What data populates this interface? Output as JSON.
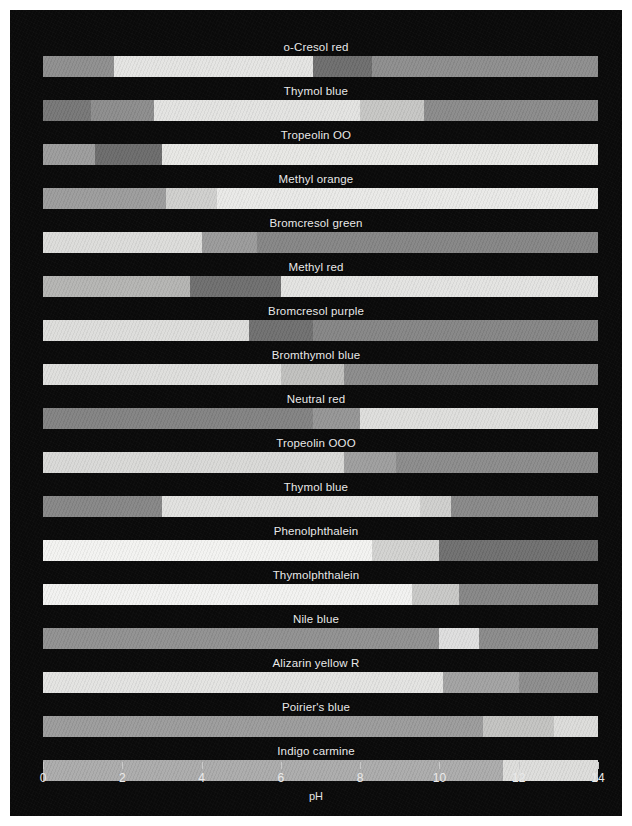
{
  "figure": {
    "background_color": "#0a0a0a",
    "plot_left_px": 33,
    "plot_right_px": 588,
    "row_height_px": 44,
    "first_row_top_px": 30
  },
  "axis": {
    "title": "pH",
    "min": 0,
    "max": 14,
    "tick_labels": [
      "0",
      "2",
      "4",
      "6",
      "8",
      "10",
      "12",
      "14"
    ],
    "tick_values": [
      0,
      2,
      4,
      6,
      8,
      10,
      12,
      14
    ],
    "tick_color": "#c9c9c9",
    "label_color": "#eaeaea"
  },
  "chart_data": {
    "type": "bar",
    "title": "",
    "subtitle": "",
    "xlabel": "pH",
    "ylabel": "",
    "xlim": [
      0,
      14
    ],
    "grid": false,
    "legend": "none",
    "orientation": "horizontal-stacked-range",
    "categories": [
      "o-Cresol red",
      "Thymol blue",
      "Tropeolin OO",
      "Methyl orange",
      "Bromcresol green",
      "Methyl red",
      "Bromcresol purple",
      "Bromthymol blue",
      "Neutral red",
      "Tropeolin OOO",
      "Thymol blue",
      "Phenolphthalein",
      "Thymolphthalein",
      "Nile blue",
      "Alizarin yellow R",
      "Poirier's blue",
      "Indigo carmine"
    ],
    "rows": [
      {
        "label": "o-Cresol red",
        "segments": [
          {
            "start": 0.0,
            "end": 1.8,
            "color": "#8e8e8e"
          },
          {
            "start": 1.8,
            "end": 6.8,
            "color": "#e4e4e2"
          },
          {
            "start": 6.8,
            "end": 8.3,
            "color": "#6d6d6d"
          },
          {
            "start": 8.3,
            "end": 14.0,
            "color": "#8d8d8d"
          }
        ]
      },
      {
        "label": "Thymol blue",
        "segments": [
          {
            "start": 0.0,
            "end": 1.2,
            "color": "#767676"
          },
          {
            "start": 1.2,
            "end": 2.8,
            "color": "#8c8c8c"
          },
          {
            "start": 2.8,
            "end": 8.0,
            "color": "#e3e3e1"
          },
          {
            "start": 8.0,
            "end": 9.6,
            "color": "#c6c6c4"
          },
          {
            "start": 9.6,
            "end": 14.0,
            "color": "#8a8a8a"
          }
        ]
      },
      {
        "label": "Tropeolin OO",
        "segments": [
          {
            "start": 0.0,
            "end": 1.3,
            "color": "#9c9c9c"
          },
          {
            "start": 1.3,
            "end": 3.0,
            "color": "#6b6b6b"
          },
          {
            "start": 3.0,
            "end": 14.0,
            "color": "#e7e7e4"
          }
        ]
      },
      {
        "label": "Methyl orange",
        "segments": [
          {
            "start": 0.0,
            "end": 3.1,
            "color": "#9c9c9c"
          },
          {
            "start": 3.1,
            "end": 4.4,
            "color": "#cfcfcd"
          },
          {
            "start": 4.4,
            "end": 14.0,
            "color": "#e9e9e7"
          }
        ]
      },
      {
        "label": "Bromcresol green",
        "segments": [
          {
            "start": 0.0,
            "end": 4.0,
            "color": "#dcdcda"
          },
          {
            "start": 4.0,
            "end": 5.4,
            "color": "#9a9a9a"
          },
          {
            "start": 5.4,
            "end": 14.0,
            "color": "#858585"
          }
        ]
      },
      {
        "label": "Methyl red",
        "segments": [
          {
            "start": 0.0,
            "end": 3.7,
            "color": "#b4b4b2"
          },
          {
            "start": 3.7,
            "end": 6.0,
            "color": "#6e6e6e"
          },
          {
            "start": 6.0,
            "end": 14.0,
            "color": "#e3e3e1"
          }
        ]
      },
      {
        "label": "Bromcresol purple",
        "segments": [
          {
            "start": 0.0,
            "end": 5.2,
            "color": "#dddddb"
          },
          {
            "start": 5.2,
            "end": 6.8,
            "color": "#6f6f6f"
          },
          {
            "start": 6.8,
            "end": 14.0,
            "color": "#858585"
          }
        ]
      },
      {
        "label": "Bromthymol blue",
        "segments": [
          {
            "start": 0.0,
            "end": 6.0,
            "color": "#dededc"
          },
          {
            "start": 6.0,
            "end": 7.6,
            "color": "#c0c0be"
          },
          {
            "start": 7.6,
            "end": 14.0,
            "color": "#8b8b8b"
          }
        ]
      },
      {
        "label": "Neutral red",
        "segments": [
          {
            "start": 0.0,
            "end": 6.8,
            "color": "#828282"
          },
          {
            "start": 6.8,
            "end": 8.0,
            "color": "#959595"
          },
          {
            "start": 8.0,
            "end": 14.0,
            "color": "#dededc"
          }
        ]
      },
      {
        "label": "Tropeolin OOO",
        "segments": [
          {
            "start": 0.0,
            "end": 7.6,
            "color": "#d9d9d7"
          },
          {
            "start": 7.6,
            "end": 8.9,
            "color": "#9e9e9e"
          },
          {
            "start": 8.9,
            "end": 14.0,
            "color": "#8b8b8b"
          }
        ]
      },
      {
        "label": "Thymol blue",
        "segments": [
          {
            "start": 0.0,
            "end": 3.0,
            "color": "#868686"
          },
          {
            "start": 3.0,
            "end": 9.5,
            "color": "#e1e1df"
          },
          {
            "start": 9.5,
            "end": 10.3,
            "color": "#cfcfcd"
          },
          {
            "start": 10.3,
            "end": 14.0,
            "color": "#888888"
          }
        ]
      },
      {
        "label": "Phenolphthalein",
        "segments": [
          {
            "start": 0.0,
            "end": 8.3,
            "color": "#f3f3f1"
          },
          {
            "start": 8.3,
            "end": 10.0,
            "color": "#d2d2d0"
          },
          {
            "start": 10.0,
            "end": 14.0,
            "color": "#6f6f6f"
          }
        ]
      },
      {
        "label": "Thymolphthalein",
        "segments": [
          {
            "start": 0.0,
            "end": 9.3,
            "color": "#f2f2f0"
          },
          {
            "start": 9.3,
            "end": 10.5,
            "color": "#c8c8c6"
          },
          {
            "start": 10.5,
            "end": 14.0,
            "color": "#868686"
          }
        ]
      },
      {
        "label": "Nile blue",
        "segments": [
          {
            "start": 0.0,
            "end": 10.0,
            "color": "#909090"
          },
          {
            "start": 10.0,
            "end": 11.0,
            "color": "#dedede"
          },
          {
            "start": 11.0,
            "end": 14.0,
            "color": "#8a8a8a"
          }
        ]
      },
      {
        "label": "Alizarin yellow R",
        "segments": [
          {
            "start": 0.0,
            "end": 10.1,
            "color": "#e3e3e1"
          },
          {
            "start": 10.1,
            "end": 12.0,
            "color": "#a2a2a2"
          },
          {
            "start": 12.0,
            "end": 14.0,
            "color": "#8c8c8c"
          }
        ]
      },
      {
        "label": "Poirier's blue",
        "segments": [
          {
            "start": 0.0,
            "end": 11.1,
            "color": "#9b9b9b"
          },
          {
            "start": 11.1,
            "end": 12.9,
            "color": "#c3c3c1"
          },
          {
            "start": 12.9,
            "end": 14.0,
            "color": "#dcdcda"
          }
        ]
      },
      {
        "label": "Indigo carmine",
        "segments": [
          {
            "start": 0.0,
            "end": 11.6,
            "color": "#ababab"
          },
          {
            "start": 11.6,
            "end": 14.0,
            "color": "#dddddb"
          }
        ]
      }
    ]
  }
}
